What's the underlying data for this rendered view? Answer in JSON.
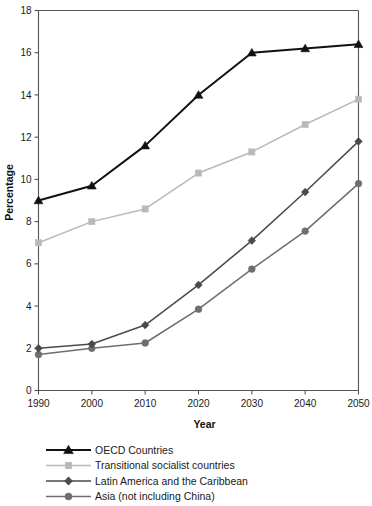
{
  "chart_data": {
    "type": "line",
    "title": "",
    "xlabel": "Year",
    "ylabel": "Percentage",
    "x": [
      1990,
      2000,
      2010,
      2020,
      2030,
      2040,
      2050
    ],
    "categories": [
      "1990",
      "2000",
      "2010",
      "2020",
      "2030",
      "2040",
      "2050"
    ],
    "xlim": [
      1990,
      2050
    ],
    "ylim": [
      0,
      18
    ],
    "yticks": [
      0,
      2,
      4,
      6,
      8,
      10,
      12,
      14,
      16,
      18
    ],
    "ytick_labels": [
      "0",
      "2",
      "4",
      "6",
      "8",
      "10",
      "12",
      "14",
      "16",
      "18"
    ],
    "grid": false,
    "legend_position": "below-left",
    "series": [
      {
        "name": "OECD Countries",
        "marker": "triangle",
        "color": "#111111",
        "values": [
          9.0,
          9.7,
          11.6,
          14.0,
          16.0,
          16.2,
          16.4
        ]
      },
      {
        "name": "Transitional socialist countries",
        "marker": "square",
        "color": "#b9b9b9",
        "values": [
          7.0,
          8.0,
          8.6,
          10.3,
          11.3,
          12.6,
          13.8
        ]
      },
      {
        "name": "Latin America and the Caribbean",
        "marker": "diamond",
        "color": "#4a4a4a",
        "values": [
          2.0,
          2.2,
          3.1,
          5.0,
          7.1,
          9.4,
          11.8
        ]
      },
      {
        "name": "Asia (not including China)",
        "marker": "circle",
        "color": "#6e6e6e",
        "values": [
          1.7,
          2.0,
          2.25,
          3.85,
          5.75,
          7.55,
          9.8
        ]
      }
    ]
  },
  "axes": {
    "y_label": "Percentage",
    "x_label": "Year"
  },
  "legend": {
    "items": [
      {
        "label": "OECD Countries",
        "marker": "triangle-marker",
        "color": "#111111"
      },
      {
        "label": "Transitional socialist countries",
        "marker": "square-marker",
        "color": "#b9b9b9"
      },
      {
        "label": "Latin America and the Caribbean",
        "marker": "diamond-marker",
        "color": "#4a4a4a"
      },
      {
        "label": "Asia (not including China)",
        "marker": "circle-marker",
        "color": "#6e6e6e"
      }
    ]
  },
  "colors": {
    "axis": "#555555",
    "text": "#1a1a1a",
    "background": "#ffffff"
  }
}
